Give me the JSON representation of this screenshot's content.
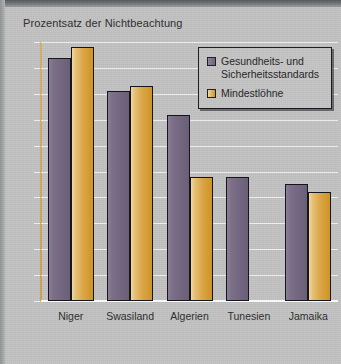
{
  "chart_data": {
    "type": "bar",
    "title": "Prozentsatz der Nichtbeachtung",
    "xlabel": "",
    "ylabel": "",
    "ylim": [
      0,
      100
    ],
    "yticks": [
      0,
      10,
      20,
      30,
      40,
      50,
      60,
      70,
      80,
      90,
      100
    ],
    "grid": true,
    "legend_position": "top-right",
    "categories": [
      "Niger",
      "Swasiland",
      "Algerien",
      "Tunesien",
      "Jamaika"
    ],
    "series": [
      {
        "name": "Gesundheits- und Sicherheitsstandards",
        "color": "#776b83",
        "values": [
          94,
          81,
          72,
          48,
          45
        ]
      },
      {
        "name": "Mindestlöhne",
        "color": "#d7a23c",
        "values": [
          98,
          83,
          48,
          null,
          42
        ]
      }
    ]
  },
  "legend": {
    "entries": [
      {
        "label": "Gesundheits- und Sicherheitsstandards",
        "swatch": "legend-swatch-health-safety"
      },
      {
        "label": "Mindestlöhne",
        "swatch": "legend-swatch-minimum-wage"
      }
    ]
  }
}
